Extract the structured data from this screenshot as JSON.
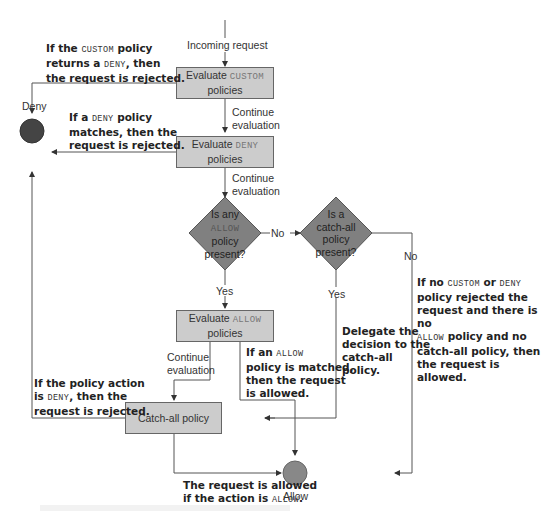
{
  "diagram": {
    "colors": {
      "box_fill": "#cccccc",
      "diamond_fill": "#808080",
      "deny_node": "#444444",
      "allow_node": "#888888",
      "line": "#555555"
    },
    "start_label": "Incoming request",
    "nodes": {
      "custom_box": {
        "prefix": "Evaluate ",
        "keyword": "CUSTOM",
        "suffix": "policies"
      },
      "deny_box": {
        "prefix": "Evaluate ",
        "keyword": "DENY",
        "suffix": "policies"
      },
      "allow_box": {
        "prefix": "Evaluate ",
        "keyword": "ALLOW",
        "suffix": "policies"
      },
      "catchall_box": {
        "label": "Catch-all policy"
      },
      "allow_diamond": {
        "line1": "Is any",
        "keyword": "ALLOW",
        "line3": "policy",
        "line4": "present?"
      },
      "catchall_diamond": {
        "line1": "Is a",
        "line2": "catch-all",
        "line3": "policy",
        "line4": "present?"
      },
      "deny_terminal": {
        "label": "Deny"
      },
      "allow_terminal": {
        "label": "Allow"
      }
    },
    "edge_labels": {
      "continue1": [
        "Continue",
        "evaluation"
      ],
      "continue2": [
        "Continue",
        "evaluation"
      ],
      "continue3": [
        "Continue",
        "evaluation"
      ],
      "no1": "No",
      "no2": "No",
      "yes1": "Yes",
      "yes2": "Yes"
    },
    "notes": {
      "custom_deny": {
        "a": "If the ",
        "k": "CUSTOM",
        "b": " policy",
        "c": "returns a ",
        "k2": "DENY",
        "d": ", then",
        "e": "the request is rejected."
      },
      "deny_match": {
        "a": "If a ",
        "k": "DENY",
        "b": " policy",
        "c": "matches, then the",
        "d": "request is rejected."
      },
      "catchall_deny": {
        "a": "If the policy action",
        "b": "is ",
        "k": "DENY",
        "c": ", then the",
        "d": "request is rejected."
      },
      "allow_match": {
        "a": "If an ",
        "k": "ALLOW",
        "b": "policy is matched,",
        "c": "then the request",
        "d": "is allowed."
      },
      "delegate": {
        "a": "Delegate the",
        "b": "decision to the",
        "c": "catch-all",
        "d": "policy."
      },
      "no_policy": {
        "a": "If no ",
        "k": "CUSTOM",
        "b": " or ",
        "k2": "DENY",
        "c": "policy rejected the",
        "d": "request and there is no",
        "k3": "ALLOW",
        "e": " policy and no",
        "f": "catch-all policy, then",
        "g": "the request is allowed."
      },
      "catchall_allow": {
        "a": "The request is allowed",
        "b": "if the action is ",
        "k": "ALLOW",
        "c": "."
      }
    }
  }
}
